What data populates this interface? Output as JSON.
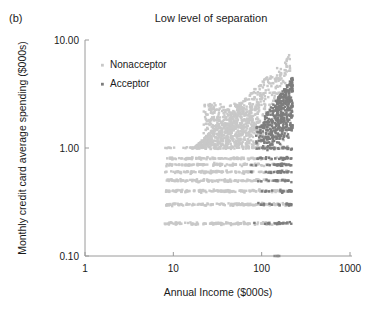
{
  "panel": {
    "label": "(b)"
  },
  "chart_data": {
    "type": "scatter",
    "title": "Low level of separation",
    "xlabel": "Annual Income ($000s)",
    "ylabel": "Monthly credit card average spending ($000s)",
    "xscale": "log",
    "yscale": "log",
    "xlim": [
      1,
      1000
    ],
    "ylim": [
      0.1,
      10
    ],
    "xticks": [
      1,
      10,
      100,
      1000
    ],
    "xticklabels": [
      "1",
      "10",
      "100",
      "1000"
    ],
    "yticks": [
      0.1,
      1.0,
      10.0
    ],
    "yticklabels": [
      "0.10",
      "1.00",
      "10.00"
    ],
    "grid": false,
    "legend_position": "upper-left-inside",
    "colors": {
      "nonacceptor": "#c8c8c8",
      "acceptor": "#7d7d7d",
      "axis": "#9a9a9a",
      "text": "#1a1a1a",
      "background": "#ffffff"
    },
    "series": [
      {
        "name": "Nonacceptor",
        "color": "#c8c8c8",
        "marker": "square",
        "marker_size": 2.4,
        "point_count": 1900,
        "x_range": [
          8,
          220
        ],
        "y_range": [
          0.2,
          9.2
        ],
        "description": "Large light-gray mass spanning low to high income; discrete horizontal spending bands at 0.2, 0.3, 0.4, 0.5, 0.6, 0.7, 0.8, 1.0 and a dense wedge rising from 1.0 to 9 as income grows; overlaps heavily with acceptors."
      },
      {
        "name": "Acceptor",
        "color": "#7d7d7d",
        "marker": "square",
        "marker_size": 2.4,
        "point_count": 520,
        "x_range": [
          70,
          225
        ],
        "y_range": [
          0.1,
          10.0
        ],
        "description": "Darker points concentrated at high income (90-225) and spending 1-10, with a thinner tail of low-spending points along the 0.2-1.0 bands and a few markers resting on the 0.10 baseline near income 150."
      }
    ],
    "annotation": "Acceptor and Nonacceptor clouds overlap substantially, illustrating low class separation."
  },
  "legend": {
    "items": [
      {
        "label": "Nonacceptor",
        "color": "#c8c8c8"
      },
      {
        "label": "Acceptor",
        "color": "#7d7d7d"
      }
    ]
  }
}
